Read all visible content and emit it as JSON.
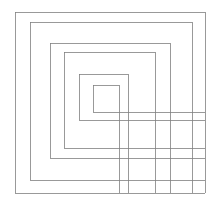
{
  "figure": {
    "canvas": {
      "width": 218,
      "height": 202,
      "background_color": "#ffffff"
    },
    "style": {
      "stroke_color": "#808080",
      "stroke_width": 0.8,
      "fill": "none"
    },
    "overshoot": {
      "right_edge_bottom_y": 193,
      "bottom_edge_right_x": 205
    }
  },
  "chart_data": {
    "type": "line",
    "xlabel": "",
    "ylabel": "",
    "xlim": [
      0,
      218
    ],
    "ylim": [
      0,
      202
    ],
    "grid": false,
    "legend": "none",
    "series": [
      {
        "name": "square-1-outer",
        "left": 15,
        "top": 12,
        "right": 205,
        "bottom": 193,
        "path": "M 15 193 L 15 12 L 205 12 L 205 193 L 15 193"
      },
      {
        "name": "square-2",
        "left": 30,
        "top": 22,
        "right": 192,
        "bottom": 180,
        "path": "M 30 180 L 30 22 L 192 22 L 192 193 M 30 180 L 205 180"
      },
      {
        "name": "square-3",
        "left": 50,
        "top": 43,
        "right": 170,
        "bottom": 158,
        "path": "M 50 158 L 50 43 L 170 43 L 170 193 M 50 158 L 205 158"
      },
      {
        "name": "square-4",
        "left": 64,
        "top": 52,
        "right": 155,
        "bottom": 148,
        "path": "M 64 148 L 64 52 L 155 52 L 155 193 M 64 148 L 205 148"
      },
      {
        "name": "square-5",
        "left": 79,
        "top": 74,
        "right": 128,
        "bottom": 120,
        "path": "M 79 120 L 79 74 L 128 74 L 128 193 M 79 120 L 205 120"
      },
      {
        "name": "square-6-inner",
        "left": 93,
        "top": 85,
        "right": 119,
        "bottom": 112,
        "path": "M 93 112 L 93 85 L 119 85 L 119 193 M 93 112 L 205 112"
      }
    ]
  }
}
